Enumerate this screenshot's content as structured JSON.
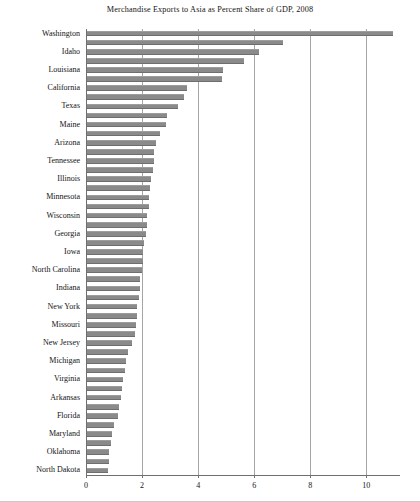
{
  "chart_data": {
    "type": "bar",
    "orientation": "horizontal",
    "title": "Merchandise Exports to Asia as Percent Share of GDP, 2008",
    "xlabel": "",
    "ylabel": "",
    "xlim": [
      0,
      11.2
    ],
    "grid": true,
    "legend": null,
    "xticks": [
      0,
      2,
      4,
      6,
      8,
      10
    ],
    "xtick_labels": [
      "0",
      "2",
      "4",
      "6",
      "8",
      "10"
    ],
    "bar_color": "#8a8a8a",
    "label_every_nth": 2,
    "categories": [
      "Washington",
      "",
      "Idaho",
      "",
      "Louisiana",
      "",
      "California",
      "",
      "Texas",
      "",
      "Maine",
      "",
      "Arizona",
      "",
      "Tennessee",
      "",
      "Illinois",
      "",
      "Minnesota",
      "",
      "Wisconsin",
      "",
      "Georgia",
      "",
      "Iowa",
      "",
      "North Carolina",
      "",
      "Indiana",
      "",
      "New York",
      "",
      "Missouri",
      "",
      "New Jersey",
      "",
      "Michigan",
      "",
      "Virginia",
      "",
      "Arkansas",
      "",
      "Florida",
      "",
      "Maryland",
      "",
      "Oklahoma",
      "",
      "North Dakota"
    ],
    "visible_labels": [
      "Washington",
      "Idaho",
      "Louisiana",
      "California",
      "Texas",
      "Maine",
      "Arizona",
      "Tennessee",
      "Illinois",
      "Minnesota",
      "Wisconsin",
      "Georgia",
      "Iowa",
      "North Carolina",
      "Indiana",
      "New York",
      "Missouri",
      "New Jersey",
      "Michigan",
      "Virginia",
      "Arkansas",
      "Florida",
      "Maryland",
      "Oklahoma",
      "North Dakota"
    ],
    "values": [
      10.9,
      7.0,
      6.15,
      5.6,
      4.85,
      4.8,
      3.55,
      3.45,
      3.25,
      2.85,
      2.8,
      2.6,
      2.45,
      2.4,
      2.4,
      2.35,
      2.3,
      2.25,
      2.2,
      2.2,
      2.15,
      2.15,
      2.1,
      2.05,
      2.0,
      2.0,
      1.95,
      1.9,
      1.9,
      1.85,
      1.8,
      1.8,
      1.75,
      1.7,
      1.6,
      1.45,
      1.4,
      1.35,
      1.3,
      1.25,
      1.2,
      1.15,
      1.1,
      0.95,
      0.9,
      0.85,
      0.8,
      0.78,
      0.75
    ]
  }
}
